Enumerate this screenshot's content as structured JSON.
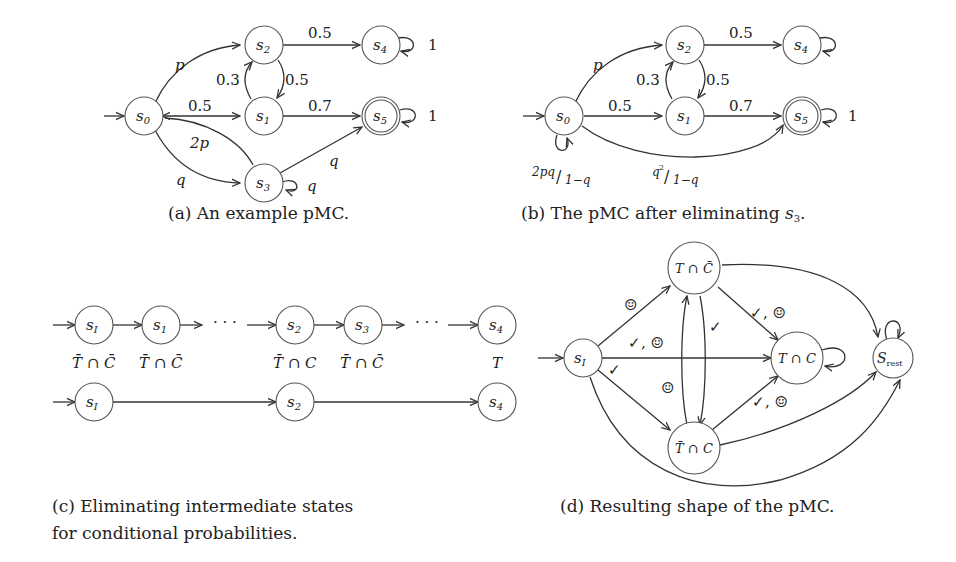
{
  "panels": {
    "a": {
      "caption": "(a) An example pMC.",
      "nodes": [
        "s0",
        "s1",
        "s2",
        "s3",
        "s4",
        "s5"
      ],
      "accepting": [
        "s5"
      ],
      "edges": [
        {
          "from": "s0",
          "to": "s2",
          "label": "p"
        },
        {
          "from": "s0",
          "to": "s1",
          "label": "0.5"
        },
        {
          "from": "s1",
          "to": "s0",
          "label": "0.5"
        },
        {
          "from": "s0",
          "to": "s3",
          "label": "q"
        },
        {
          "from": "s3",
          "to": "s0",
          "label": "2p"
        },
        {
          "from": "s1",
          "to": "s2",
          "label": "0.3"
        },
        {
          "from": "s2",
          "to": "s1",
          "label": "0.5"
        },
        {
          "from": "s2",
          "to": "s4",
          "label": "0.5"
        },
        {
          "from": "s1",
          "to": "s5",
          "label": "0.7"
        },
        {
          "from": "s3",
          "to": "s5",
          "label": "q"
        },
        {
          "from": "s3",
          "to": "s3",
          "label": "q"
        },
        {
          "from": "s4",
          "to": "s4",
          "label": "1"
        },
        {
          "from": "s5",
          "to": "s5",
          "label": "1"
        }
      ],
      "labels": {
        "p": "p",
        "half": "0.5",
        "q": "q",
        "twop": "2p",
        "pt3": "0.3",
        "pt7": "0.7",
        "one": "1"
      }
    },
    "b": {
      "caption_prefix": "(b) The pMC after eliminating ",
      "caption_state": "s",
      "caption_sub": "3",
      "caption_suffix": ".",
      "nodes": [
        "s0",
        "s1",
        "s2",
        "s4",
        "s5"
      ],
      "accepting": [
        "s5"
      ],
      "edges": [
        {
          "from": "s0",
          "to": "s2",
          "label": "p"
        },
        {
          "from": "s0",
          "to": "s1",
          "label": "0.5"
        },
        {
          "from": "s1",
          "to": "s2",
          "label": "0.3"
        },
        {
          "from": "s2",
          "to": "s1",
          "label": "0.5"
        },
        {
          "from": "s2",
          "to": "s4",
          "label": "0.5"
        },
        {
          "from": "s1",
          "to": "s5",
          "label": "0.7"
        },
        {
          "from": "s0",
          "to": "s0",
          "label": "2pq/1−q"
        },
        {
          "from": "s0",
          "to": "s5",
          "label": "q²/1−q"
        },
        {
          "from": "s4",
          "to": "s4",
          "label": "1"
        },
        {
          "from": "s5",
          "to": "s5",
          "label": "1"
        }
      ],
      "labels": {
        "selfloop_num": "2pq",
        "selfloop_den": "1−q",
        "direct_num": "q",
        "direct_sup": "2",
        "direct_den": "1−q"
      }
    },
    "c": {
      "caption_line1": "(c) Eliminating intermediate states",
      "caption_line2": "for conditional probabilities.",
      "row1": [
        {
          "state": "s",
          "sub": "I",
          "annotation": "T̄ ∩ C̄"
        },
        {
          "state": "s",
          "sub": "1",
          "annotation": "T̄ ∩ C̄"
        },
        {
          "ellipsis": "· · ·"
        },
        {
          "state": "s",
          "sub": "2",
          "annotation": "T̄ ∩ C"
        },
        {
          "state": "s",
          "sub": "3",
          "annotation": "T̄ ∩ C̄"
        },
        {
          "ellipsis": "· · ·"
        },
        {
          "state": "s",
          "sub": "4",
          "annotation": "T"
        }
      ],
      "row2": [
        {
          "state": "s",
          "sub": "I"
        },
        {
          "state": "s",
          "sub": "2"
        },
        {
          "state": "s",
          "sub": "4"
        }
      ],
      "ellipsis": "· · ·"
    },
    "d": {
      "caption": "(d) Resulting shape of the pMC.",
      "nodes": {
        "init": {
          "state": "s",
          "sub": "I"
        },
        "top": {
          "label": "T ∩ C̄"
        },
        "mid": {
          "label": "T ∩ C"
        },
        "bot": {
          "label": "T̄ ∩ C"
        },
        "rest": {
          "state": "S",
          "sub": "rest"
        }
      },
      "edge_labels": {
        "smile": "☺",
        "check": "✓",
        "check_smile": "✓, ☺"
      }
    }
  }
}
